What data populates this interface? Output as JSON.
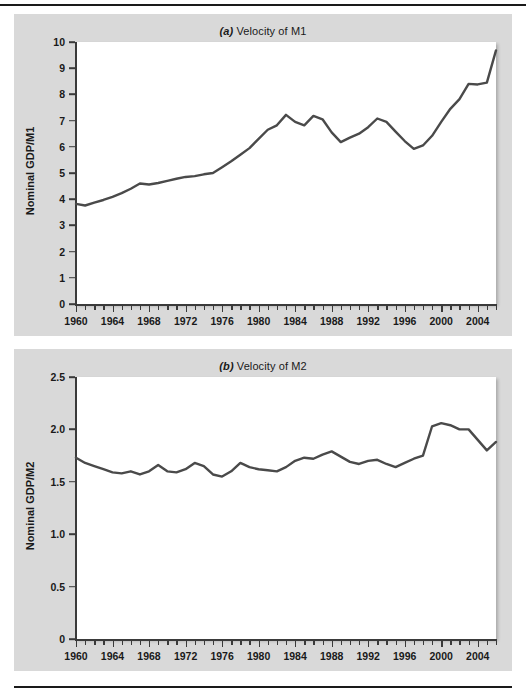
{
  "figure": {
    "panels": [
      {
        "id": "a",
        "marker": "(a)",
        "title_text": " Velocity of M1",
        "ylabel": "Nominal GDP/M1",
        "accent": "#4a4a4a",
        "panel_bg": "#d9d9d9",
        "plot_bg": "#ffffff"
      },
      {
        "id": "b",
        "marker": "(b)",
        "title_text": " Velocity of M2",
        "ylabel": "Nominal GDP/M2",
        "accent": "#4a4a4a",
        "panel_bg": "#d9d9d9",
        "plot_bg": "#ffffff"
      }
    ]
  },
  "chart_data": [
    {
      "type": "line",
      "title": "(a) Velocity of M1",
      "xlabel": "",
      "ylabel": "Nominal GDP/M1",
      "xlim": [
        1960,
        2006
      ],
      "ylim": [
        0,
        10
      ],
      "yticks": [
        0,
        1,
        2,
        3,
        4,
        5,
        6,
        7,
        8,
        9,
        10
      ],
      "ytick_labels": [
        "0",
        "1",
        "2",
        "3",
        "4",
        "5",
        "6",
        "7",
        "8",
        "9",
        "10"
      ],
      "xticks": [
        1960,
        1964,
        1968,
        1972,
        1976,
        1980,
        1984,
        1988,
        1992,
        1996,
        2000,
        2004
      ],
      "xtick_labels": [
        "1960",
        "1964",
        "1968",
        "1972",
        "1976",
        "1980",
        "1984",
        "1988",
        "1992",
        "1996",
        "2000",
        "2004"
      ],
      "minor_xtick_interval": 1,
      "grid": false,
      "legend": "none",
      "series": [
        {
          "name": "Velocity of M1",
          "color": "#4a4a4a",
          "x": [
            1960,
            1961,
            1962,
            1963,
            1964,
            1965,
            1966,
            1967,
            1968,
            1969,
            1970,
            1971,
            1972,
            1973,
            1974,
            1975,
            1976,
            1977,
            1978,
            1979,
            1980,
            1981,
            1982,
            1983,
            1984,
            1985,
            1986,
            1987,
            1988,
            1989,
            1990,
            1991,
            1992,
            1993,
            1994,
            1995,
            1996,
            1997,
            1998,
            1999,
            2000,
            2001,
            2002,
            2003,
            2004,
            2005,
            2006
          ],
          "values": [
            3.82,
            3.76,
            3.87,
            3.97,
            4.09,
            4.23,
            4.4,
            4.6,
            4.56,
            4.62,
            4.7,
            4.78,
            4.85,
            4.88,
            4.95,
            5.0,
            5.22,
            5.45,
            5.7,
            5.95,
            6.3,
            6.65,
            6.82,
            7.22,
            6.95,
            6.82,
            7.18,
            7.05,
            6.55,
            6.18,
            6.35,
            6.5,
            6.75,
            7.08,
            6.95,
            6.58,
            6.22,
            5.92,
            6.05,
            6.42,
            6.95,
            7.45,
            7.82,
            8.25,
            8.4,
            8.95,
            8.55
          ]
        }
      ],
      "series_tail": {
        "note": "final segment rises to 9.68 at end of sample",
        "x": [
          2003,
          2004,
          2005,
          2006
        ],
        "values": [
          8.4,
          8.38,
          8.45,
          9.68
        ]
      }
    },
    {
      "type": "line",
      "title": "(b) Velocity of M2",
      "xlabel": "",
      "ylabel": "Nominal GDP/M2",
      "xlim": [
        1960,
        2006
      ],
      "ylim": [
        0,
        2.5
      ],
      "yticks": [
        0,
        0.5,
        1.0,
        1.5,
        2.0,
        2.5
      ],
      "ytick_labels": [
        "0",
        "0.5",
        "1.0",
        "1.5",
        "2.0",
        "2.5"
      ],
      "xticks": [
        1960,
        1964,
        1968,
        1972,
        1976,
        1980,
        1984,
        1988,
        1992,
        1996,
        2000,
        2004
      ],
      "xtick_labels": [
        "1960",
        "1964",
        "1968",
        "1972",
        "1976",
        "1980",
        "1984",
        "1988",
        "1992",
        "1996",
        "2000",
        "2004"
      ],
      "minor_xtick_interval": 1,
      "grid": false,
      "legend": "none",
      "series": [
        {
          "name": "Velocity of M2",
          "color": "#4a4a4a",
          "x": [
            1960,
            1961,
            1962,
            1963,
            1964,
            1965,
            1966,
            1967,
            1968,
            1969,
            1970,
            1971,
            1972,
            1973,
            1974,
            1975,
            1976,
            1977,
            1978,
            1979,
            1980,
            1981,
            1982,
            1983,
            1984,
            1985,
            1986,
            1987,
            1988,
            1989,
            1990,
            1991,
            1992,
            1993,
            1994,
            1995,
            1996,
            1997,
            1998,
            1999,
            2000,
            2001,
            2002,
            2003,
            2004,
            2005,
            2006
          ],
          "values": [
            1.73,
            1.68,
            1.65,
            1.62,
            1.59,
            1.58,
            1.6,
            1.57,
            1.6,
            1.66,
            1.6,
            1.59,
            1.62,
            1.68,
            1.65,
            1.57,
            1.55,
            1.6,
            1.68,
            1.64,
            1.62,
            1.61,
            1.6,
            1.64,
            1.7,
            1.73,
            1.72,
            1.76,
            1.79,
            1.74,
            1.69,
            1.67,
            1.7,
            1.71,
            1.67,
            1.64,
            1.68,
            1.72,
            1.75,
            1.77,
            1.78,
            1.84,
            1.92,
            2.0,
            2.02,
            2.05,
            2.06
          ]
        }
      ],
      "series_tail": {
        "note": "after peak near 2.06 the series falls to about 1.80 and recovers to 1.88 at the end",
        "x": [
          1999,
          2000,
          2001,
          2002,
          2003,
          2004,
          2005,
          2006
        ],
        "values": [
          2.03,
          2.06,
          2.04,
          2.0,
          2.0,
          1.9,
          1.8,
          1.88
        ]
      }
    }
  ]
}
